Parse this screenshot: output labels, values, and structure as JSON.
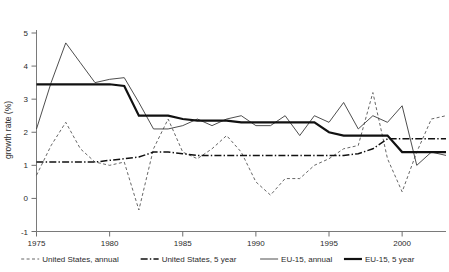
{
  "chart_data": {
    "type": "line",
    "title": "",
    "xlabel": "",
    "ylabel": "growth rate (%)",
    "xlim": [
      1975,
      2003
    ],
    "ylim": [
      -1,
      5
    ],
    "grid": false,
    "legend_position": "bottom",
    "xticks": [
      "1975",
      "1980",
      "1985",
      "1990",
      "1995",
      "2000"
    ],
    "xtick_values": [
      1975,
      1980,
      1985,
      1990,
      1995,
      2000
    ],
    "yticks": [
      "-1",
      "0",
      "1",
      "2",
      "3",
      "4",
      "5"
    ],
    "ytick_values": [
      -1,
      0,
      1,
      2,
      3,
      4,
      5
    ],
    "x": [
      1975,
      1976,
      1977,
      1978,
      1979,
      1980,
      1981,
      1982,
      1983,
      1984,
      1985,
      1986,
      1987,
      1988,
      1989,
      1990,
      1991,
      1992,
      1993,
      1994,
      1995,
      1996,
      1997,
      1998,
      1999,
      2000,
      2001,
      2002,
      2003
    ],
    "series": [
      {
        "name": "United States, annual",
        "style": "dashed",
        "color": "#555555",
        "values": [
          0.7,
          1.6,
          2.3,
          1.5,
          1.1,
          1.0,
          1.1,
          -0.35,
          1.5,
          2.4,
          1.4,
          1.2,
          1.5,
          1.9,
          1.4,
          0.5,
          0.1,
          0.6,
          0.6,
          1.0,
          1.2,
          1.5,
          1.6,
          3.2,
          1.2,
          0.2,
          1.4,
          2.4,
          2.5
        ]
      },
      {
        "name": "United States, 5 year",
        "style": "dash-dot",
        "color": "#111111",
        "values": [
          1.1,
          1.1,
          1.1,
          1.1,
          1.1,
          1.15,
          1.2,
          1.25,
          1.4,
          1.4,
          1.35,
          1.3,
          1.3,
          1.3,
          1.3,
          1.3,
          1.3,
          1.3,
          1.3,
          1.3,
          1.3,
          1.3,
          1.35,
          1.5,
          1.8,
          1.8,
          1.8,
          1.8,
          1.8
        ]
      },
      {
        "name": "EU-15, annual",
        "style": "solid-thin",
        "color": "#3a3a3a",
        "values": [
          2.1,
          3.5,
          4.7,
          4.1,
          3.5,
          3.6,
          3.65,
          2.9,
          2.1,
          2.1,
          2.2,
          2.4,
          2.2,
          2.4,
          2.5,
          2.2,
          2.2,
          2.5,
          1.9,
          2.5,
          2.3,
          2.9,
          2.1,
          2.5,
          2.3,
          2.8,
          1.0,
          1.4,
          1.3
        ]
      },
      {
        "name": "EU-15, 5 year",
        "style": "solid-thick",
        "color": "#111111",
        "values": [
          3.45,
          3.45,
          3.45,
          3.45,
          3.45,
          3.45,
          3.4,
          2.5,
          2.5,
          2.5,
          2.4,
          2.35,
          2.35,
          2.35,
          2.3,
          2.3,
          2.3,
          2.3,
          2.3,
          2.3,
          2.0,
          1.9,
          1.9,
          1.9,
          1.9,
          1.4,
          1.4,
          1.4,
          1.4
        ]
      }
    ]
  },
  "legend": {
    "items": [
      {
        "label": "United States, annual",
        "style": "dashed"
      },
      {
        "label": "United States, 5 year",
        "style": "dash-dot"
      },
      {
        "label": "EU-15, annual",
        "style": "solid-thin"
      },
      {
        "label": "EU-15, 5 year",
        "style": "solid-thick"
      }
    ]
  }
}
